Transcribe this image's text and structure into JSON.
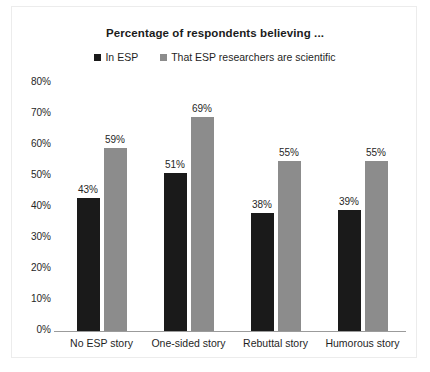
{
  "chart_data": {
    "type": "bar",
    "title": "Percentage of respondents believing ...",
    "xlabel": "",
    "ylabel": "",
    "ylim": [
      0,
      80
    ],
    "ytick_labels": [
      "80%",
      "70%",
      "60%",
      "50%",
      "40%",
      "30%",
      "20%",
      "10%",
      "0%"
    ],
    "yticks": [
      80,
      70,
      60,
      50,
      40,
      30,
      20,
      10,
      0
    ],
    "grid": false,
    "legend_position": "top-center",
    "categories": [
      "No ESP story",
      "One-sided story",
      "Rebuttal story",
      "Humorous story"
    ],
    "series": [
      {
        "name": "In ESP",
        "color": "#1a1a1a",
        "values": [
          43,
          51,
          38,
          39
        ],
        "labels": [
          "43%",
          "51%",
          "38%",
          "39%"
        ]
      },
      {
        "name": "That ESP researchers are scientific",
        "color": "#8c8c8c",
        "values": [
          59,
          69,
          55,
          55
        ],
        "labels": [
          "59%",
          "69%",
          "55%",
          "55%"
        ]
      }
    ]
  }
}
